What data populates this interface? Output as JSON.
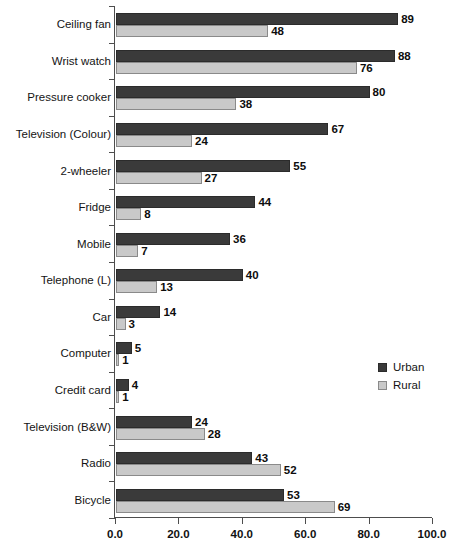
{
  "chart_data": {
    "type": "bar",
    "orientation": "horizontal",
    "title": "",
    "subtitle": "",
    "xlabel": "",
    "ylabel": "",
    "xlim": [
      0,
      100
    ],
    "xticks": [
      "0.0",
      "20.0",
      "40.0",
      "60.0",
      "80.0",
      "100.0"
    ],
    "xtick_values": [
      0,
      20,
      40,
      60,
      80,
      100
    ],
    "grid": false,
    "legend_position": "right-middle",
    "categories": [
      "Ceiling fan",
      "Wrist watch",
      "Pressure cooker",
      "Television (Colour)",
      "2-wheeler",
      "Fridge",
      "Mobile",
      "Telephone (L)",
      "Car",
      "Computer",
      "Credit card",
      "Television (B&W)",
      "Radio",
      "Bicycle"
    ],
    "series": [
      {
        "name": "Urban",
        "color": "#3a3a3a",
        "values": [
          89,
          88,
          80,
          67,
          55,
          44,
          36,
          40,
          14,
          5,
          4,
          24,
          43,
          53
        ]
      },
      {
        "name": "Rural",
        "color": "#c9c9c9",
        "values": [
          48,
          76,
          38,
          24,
          27,
          8,
          7,
          13,
          3,
          1,
          1,
          28,
          52,
          69
        ]
      }
    ]
  },
  "legend": {
    "entries": [
      {
        "label": "Urban",
        "color": "#3a3a3a"
      },
      {
        "label": "Rural",
        "color": "#c9c9c9"
      }
    ]
  }
}
